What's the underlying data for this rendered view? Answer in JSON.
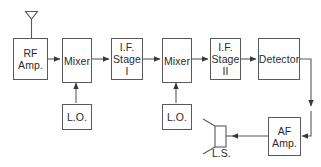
{
  "diagram": {
    "line_color": "#5a5a5a",
    "text_color": "#2b2b2b",
    "background": "#ffffff",
    "blocks": [
      {
        "id": "rf_amp",
        "lines": [
          "RF",
          "Amp."
        ]
      },
      {
        "id": "mixer_1",
        "lines": [
          "Mixer"
        ]
      },
      {
        "id": "if_stage_1",
        "lines": [
          "I.F.",
          "Stage",
          "I"
        ]
      },
      {
        "id": "mixer_2",
        "lines": [
          "Mixer"
        ]
      },
      {
        "id": "if_stage_2",
        "lines": [
          "I.F.",
          "Stage",
          "II"
        ]
      },
      {
        "id": "detector",
        "lines": [
          "Detector"
        ]
      },
      {
        "id": "lo_1",
        "lines": [
          "L.O."
        ]
      },
      {
        "id": "lo_2",
        "lines": [
          "L.O."
        ]
      },
      {
        "id": "af_amp",
        "lines": [
          "AF",
          "Amp."
        ]
      }
    ],
    "symbols": [
      {
        "id": "antenna",
        "label": ""
      },
      {
        "id": "loudspeaker",
        "label": "L.S."
      }
    ]
  }
}
